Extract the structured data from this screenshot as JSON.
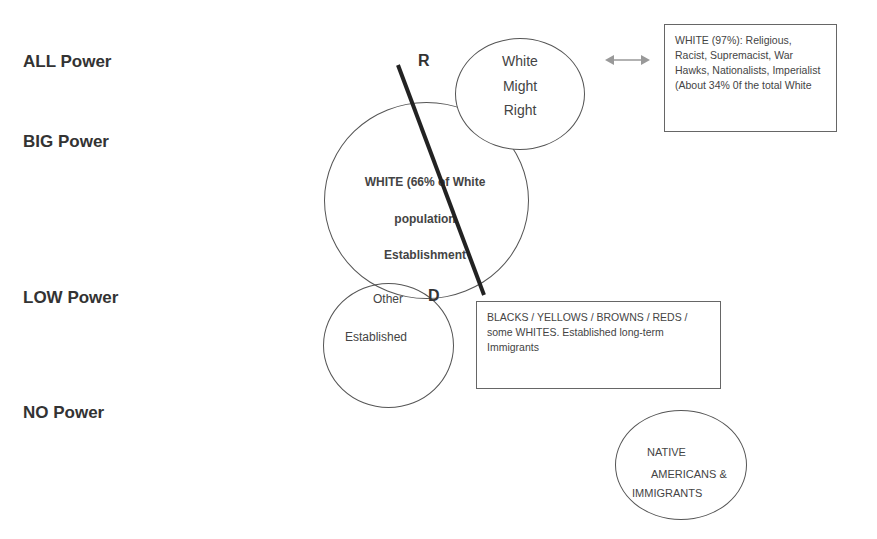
{
  "power_levels": [
    {
      "label": "ALL Power"
    },
    {
      "label": "BIG Power"
    },
    {
      "label": "LOW Power"
    },
    {
      "label": "NO Power"
    }
  ],
  "markers": {
    "top": "R",
    "bottom": "D"
  },
  "circles": {
    "might_right": {
      "lines": [
        "White",
        "Might",
        "Right"
      ]
    },
    "white_establishment": {
      "lines": [
        "WHITE (66% of White",
        "population",
        "Establishment"
      ]
    },
    "other_established": {
      "lines": [
        "Other",
        "Established"
      ]
    },
    "native_immigrants": {
      "lines": [
        "NATIVE",
        "AMERICANS &",
        "IMMIGRANTS"
      ]
    }
  },
  "boxes": {
    "white_97": {
      "text": "WHITE (97%): Religious, Racist, Supremacist, War Hawks, Nationalists, Imperialist (About 34% 0f the total White"
    },
    "minorities": {
      "text": "BLACKS / YELLOWS / BROWNS / REDS / some WHITES. Established long-term Immigrants"
    }
  },
  "connectors": {
    "double_arrow": "bidirectional-arrow",
    "divider_line": "diagonal-divider"
  }
}
